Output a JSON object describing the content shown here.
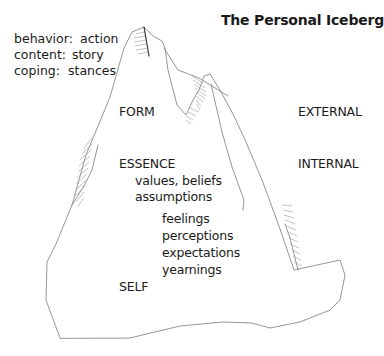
{
  "title": "The Personal Iceberg",
  "legend": [
    {
      "key": "behavior:",
      "value": "action"
    },
    {
      "key": "content:",
      "value": "story"
    },
    {
      "key": "coping:",
      "value": "stances"
    }
  ],
  "levels": {
    "form": "FORM",
    "essence": "ESSENCE",
    "self": "SELF",
    "external": "EXTERNAL",
    "internal": "INTERNAL"
  },
  "essence_items": [
    "values, beliefs",
    "assumptions"
  ],
  "inner_items": [
    "feelings",
    "perceptions",
    "expectations",
    "yearnings"
  ],
  "colors": {
    "outline": "#8a8a8a",
    "hatch": "#9a9a9a",
    "text": "#1a1a1a"
  }
}
